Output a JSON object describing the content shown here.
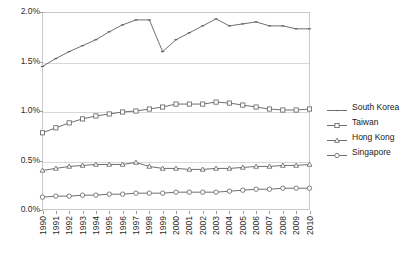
{
  "chart_data": {
    "type": "line",
    "title": "",
    "xlabel": "",
    "ylabel": "",
    "grid": true,
    "legend_position": "right",
    "ylim": [
      0.0,
      2.0
    ],
    "ytick_values": [
      2.0,
      1.5,
      1.0,
      0.5,
      0.0
    ],
    "ytick_labels": [
      "2.0%",
      "1.5%",
      "1.0%",
      "0.5%",
      "0.0%"
    ],
    "categories": [
      "1990",
      "1991",
      "1992",
      "1993",
      "1994",
      "1995",
      "1996",
      "1997",
      "1998",
      "1999",
      "2000",
      "2001",
      "2002",
      "2003",
      "2004",
      "2005",
      "2006",
      "2007",
      "2008",
      "2009",
      "2010"
    ],
    "series": [
      {
        "name": "South Korea",
        "marker": "dash",
        "values": [
          1.45,
          1.53,
          1.6,
          1.66,
          1.72,
          1.8,
          1.87,
          1.92,
          1.92,
          1.6,
          1.72,
          1.79,
          1.86,
          1.93,
          1.86,
          1.88,
          1.9,
          1.86,
          1.86,
          1.83,
          1.83
        ]
      },
      {
        "name": "Taiwan",
        "marker": "square",
        "values": [
          0.78,
          0.83,
          0.88,
          0.92,
          0.95,
          0.97,
          0.99,
          1.0,
          1.02,
          1.04,
          1.07,
          1.07,
          1.07,
          1.09,
          1.08,
          1.06,
          1.04,
          1.02,
          1.01,
          1.01,
          1.02
        ]
      },
      {
        "name": "Hong Kong",
        "marker": "triangle",
        "values": [
          0.4,
          0.42,
          0.44,
          0.45,
          0.46,
          0.46,
          0.46,
          0.48,
          0.44,
          0.42,
          0.42,
          0.41,
          0.41,
          0.42,
          0.42,
          0.43,
          0.44,
          0.44,
          0.45,
          0.45,
          0.46
        ]
      },
      {
        "name": "Singapore",
        "marker": "circle",
        "values": [
          0.13,
          0.14,
          0.14,
          0.15,
          0.15,
          0.16,
          0.16,
          0.17,
          0.17,
          0.17,
          0.18,
          0.18,
          0.18,
          0.18,
          0.19,
          0.2,
          0.21,
          0.21,
          0.22,
          0.22,
          0.22
        ]
      }
    ]
  }
}
